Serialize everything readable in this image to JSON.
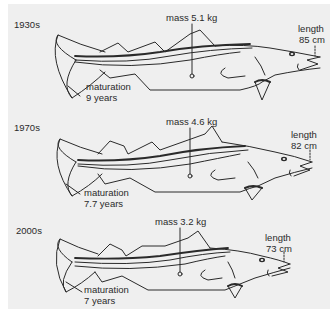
{
  "figure": {
    "background_color": "#efefef",
    "line_color": "#2a2a2a"
  },
  "panels": [
    {
      "era": "1930s",
      "mass_label": "mass 5.1 kg",
      "length_label_1": "length",
      "length_label_2": "85 cm",
      "maturation_label_1": "maturation",
      "maturation_label_2": "9 years"
    },
    {
      "era": "1970s",
      "mass_label": "mass 4.6 kg",
      "length_label_1": "length",
      "length_label_2": "82 cm",
      "maturation_label_1": "maturation",
      "maturation_label_2": "7.7 years"
    },
    {
      "era": "2000s",
      "mass_label": "mass 3.2 kg",
      "length_label_1": "length",
      "length_label_2": "73 cm",
      "maturation_label_1": "maturation",
      "maturation_label_2": "7 years"
    }
  ]
}
